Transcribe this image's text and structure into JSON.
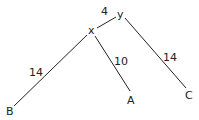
{
  "diagram": {
    "type": "phylogenetic-tree",
    "nodes": {
      "y": {
        "label": "y",
        "role": "root"
      },
      "x": {
        "label": "x",
        "role": "internal"
      },
      "A": {
        "label": "A",
        "role": "leaf"
      },
      "B": {
        "label": "B",
        "role": "leaf"
      },
      "C": {
        "label": "C",
        "role": "leaf"
      }
    },
    "edges": [
      {
        "from": "y",
        "to": "x",
        "weight": "4"
      },
      {
        "from": "x",
        "to": "B",
        "weight": "14"
      },
      {
        "from": "x",
        "to": "A",
        "weight": "10"
      },
      {
        "from": "y",
        "to": "C",
        "weight": "14"
      }
    ],
    "colors": {
      "line": "#222222",
      "text": "#222222",
      "background": "#ffffff"
    }
  }
}
